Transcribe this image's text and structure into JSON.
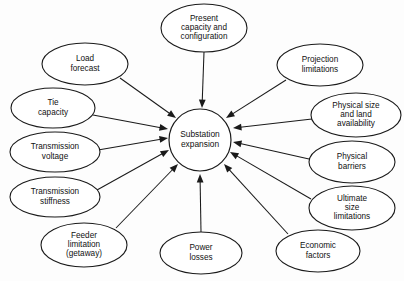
{
  "diagram": {
    "type": "hub-and-spoke-influence-diagram",
    "background_color": "#fdfdfd",
    "line_color": "#1a1a1a",
    "node_fill": "#ffffff",
    "hub": {
      "id": "substation-expansion",
      "label_lines": [
        "Substation",
        "expansion"
      ],
      "shape": "circle",
      "cx": 200,
      "cy": 140,
      "r": 31
    },
    "nodes": [
      {
        "id": "present-capacity-and-configuration",
        "label_lines": [
          "Present",
          "capacity and",
          "configuration"
        ],
        "cx": 204,
        "cy": 28,
        "rx": 43,
        "ry": 24,
        "arrow_from": [
          204,
          52
        ],
        "arrow_to": [
          202,
          108
        ]
      },
      {
        "id": "load-forecast",
        "label_lines": [
          "Load",
          "forecast"
        ],
        "cx": 85,
        "cy": 64,
        "rx": 43,
        "ry": 21,
        "arrow_from": [
          120,
          78
        ],
        "arrow_to": [
          176,
          118
        ]
      },
      {
        "id": "tie-capacity",
        "label_lines": [
          "Tie",
          "capacity"
        ],
        "cx": 53,
        "cy": 108,
        "rx": 42,
        "ry": 20,
        "arrow_from": [
          93,
          115
        ],
        "arrow_to": [
          168,
          129
        ]
      },
      {
        "id": "transmission-voltage",
        "label_lines": [
          "Transmission",
          "voltage"
        ],
        "cx": 55,
        "cy": 152,
        "rx": 45,
        "ry": 20,
        "arrow_from": [
          98,
          150
        ],
        "arrow_to": [
          168,
          138
        ]
      },
      {
        "id": "transmission-stiffness",
        "label_lines": [
          "Transmission",
          "stiffness"
        ],
        "cx": 55,
        "cy": 197,
        "rx": 45,
        "ry": 20,
        "arrow_from": [
          97,
          190
        ],
        "arrow_to": [
          169,
          150
        ]
      },
      {
        "id": "feeder-limitation-getaway",
        "label_lines": [
          "Feeder",
          "limitation",
          "(getaway)"
        ],
        "cx": 84,
        "cy": 245,
        "rx": 43,
        "ry": 22,
        "arrow_from": [
          116,
          228
        ],
        "arrow_to": [
          178,
          164
        ]
      },
      {
        "id": "power-losses",
        "label_lines": [
          "Power",
          "losses"
        ],
        "cx": 201,
        "cy": 253,
        "rx": 41,
        "ry": 21,
        "arrow_from": [
          201,
          232
        ],
        "arrow_to": [
          200,
          174
        ]
      },
      {
        "id": "economic-factors",
        "label_lines": [
          "Economic",
          "factors"
        ],
        "cx": 318,
        "cy": 251,
        "rx": 42,
        "ry": 21,
        "arrow_from": [
          288,
          234
        ],
        "arrow_to": [
          224,
          164
        ]
      },
      {
        "id": "ultimate-size-limitations",
        "label_lines": [
          "Ultimate",
          "size",
          "limitations"
        ],
        "cx": 352,
        "cy": 208,
        "rx": 43,
        "ry": 22,
        "arrow_from": [
          311,
          199
        ],
        "arrow_to": [
          230,
          152
        ]
      },
      {
        "id": "physical-barriers",
        "label_lines": [
          "Physical",
          "barriers"
        ],
        "cx": 352,
        "cy": 162,
        "rx": 43,
        "ry": 21,
        "arrow_from": [
          309,
          159
        ],
        "arrow_to": [
          233,
          142
        ]
      },
      {
        "id": "physical-size-and-land-availability",
        "label_lines": [
          "Physical size",
          "and land",
          "availability"
        ],
        "cx": 356,
        "cy": 115,
        "rx": 45,
        "ry": 22,
        "arrow_from": [
          312,
          119
        ],
        "arrow_to": [
          233,
          128
        ]
      },
      {
        "id": "projection-limitations",
        "label_lines": [
          "Projection",
          "limitations"
        ],
        "cx": 320,
        "cy": 65,
        "rx": 43,
        "ry": 21,
        "arrow_from": [
          286,
          80
        ],
        "arrow_to": [
          226,
          118
        ]
      }
    ]
  }
}
